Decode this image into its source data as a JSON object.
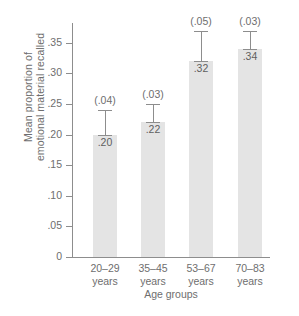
{
  "chart_data": {
    "type": "bar",
    "title": "",
    "xlabel": "Age groups",
    "ylabel_lines": [
      "Mean proportion of",
      "emotional material recalled"
    ],
    "categories": [
      "20–29 years",
      "35–45 years",
      "53–67 years",
      "70–83 years"
    ],
    "category_lines": [
      [
        "20–29",
        "years"
      ],
      [
        "35–45",
        "years"
      ],
      [
        "53–67",
        "years"
      ],
      [
        "70–83",
        "years"
      ]
    ],
    "values": [
      0.2,
      0.22,
      0.32,
      0.34
    ],
    "value_labels": [
      ".20",
      ".22",
      ".32",
      ".34"
    ],
    "errors": [
      0.04,
      0.03,
      0.05,
      0.03
    ],
    "error_labels": [
      "(.04)",
      "(.03)",
      "(.05)",
      "(.03)"
    ],
    "ylim": [
      0,
      0.385
    ],
    "yticks": [
      0,
      0.05,
      0.1,
      0.15,
      0.2,
      0.25,
      0.3,
      0.35
    ],
    "ytick_labels": [
      "0",
      ".05",
      ".10",
      ".15",
      ".20",
      ".25",
      ".30",
      ".35"
    ],
    "grid": false,
    "legend": false,
    "bar_color": "#e4e4e4",
    "axis_color": "#8d8d8d",
    "text_color": "#6e6e6e"
  },
  "caption": {
    "text": ""
  }
}
